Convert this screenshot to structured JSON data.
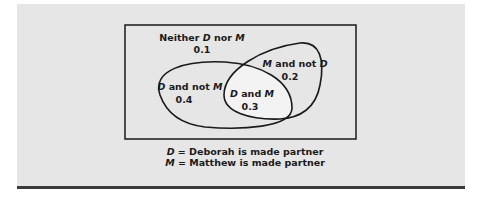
{
  "diagram": {
    "type": "venn",
    "regions": {
      "neither": {
        "label_pre": "Neither ",
        "var1": "D",
        "mid": " nor ",
        "var2": "M",
        "value": "0.1"
      },
      "d_only": {
        "var1": "D",
        "mid": " and not ",
        "var2": "M",
        "value": "0.4"
      },
      "m_only": {
        "var1": "M",
        "mid": " and not ",
        "var2": "D",
        "value": "0.2"
      },
      "both": {
        "var1": "D",
        "mid": " and ",
        "var2": "M",
        "value": "0.3"
      }
    },
    "legend": [
      {
        "var": "D",
        "text": " = Deborah is made partner"
      },
      {
        "var": "M",
        "text": " = Matthew is made partner"
      }
    ],
    "colors": {
      "panel": "#e6e6e6",
      "intersection": "#f2f2f2",
      "stroke": "#1a1a1a",
      "rule": "#3a3a3a"
    }
  }
}
